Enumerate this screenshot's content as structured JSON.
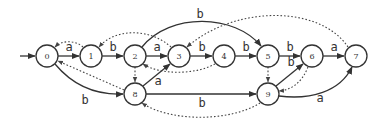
{
  "diagram": {
    "type": "automaton",
    "start_state": "0",
    "nodes": [
      {
        "id": "0",
        "label": "0",
        "x": 47,
        "y": 56
      },
      {
        "id": "1",
        "label": "1",
        "x": 91,
        "y": 56
      },
      {
        "id": "2",
        "label": "2",
        "x": 135,
        "y": 56
      },
      {
        "id": "3",
        "label": "3",
        "x": 179,
        "y": 56
      },
      {
        "id": "4",
        "label": "4",
        "x": 224,
        "y": 56
      },
      {
        "id": "5",
        "label": "5",
        "x": 268,
        "y": 56
      },
      {
        "id": "6",
        "label": "6",
        "x": 312,
        "y": 56
      },
      {
        "id": "7",
        "label": "7",
        "x": 356,
        "y": 56
      },
      {
        "id": "8",
        "label": "8",
        "x": 135,
        "y": 94
      },
      {
        "id": "9",
        "label": "9",
        "x": 268,
        "y": 94
      }
    ],
    "edges": [
      {
        "from": "0",
        "to": "1",
        "label": "a"
      },
      {
        "from": "1",
        "to": "2",
        "label": "b"
      },
      {
        "from": "2",
        "to": "3",
        "label": "a"
      },
      {
        "from": "3",
        "to": "4",
        "label": "b"
      },
      {
        "from": "4",
        "to": "5",
        "label": "b"
      },
      {
        "from": "5",
        "to": "6",
        "label": "b"
      },
      {
        "from": "6",
        "to": "7",
        "label": "a"
      },
      {
        "from": "2",
        "to": "5",
        "label": "b"
      },
      {
        "from": "0",
        "to": "8",
        "label": "b"
      },
      {
        "from": "8",
        "to": "3",
        "label": "a"
      },
      {
        "from": "8",
        "to": "9",
        "label": "b"
      },
      {
        "from": "9",
        "to": "6",
        "label": "b"
      },
      {
        "from": "9",
        "to": "7",
        "label": "a"
      }
    ],
    "failure_links": [
      {
        "from": "1",
        "to": "0"
      },
      {
        "from": "3",
        "to": "1"
      },
      {
        "from": "4",
        "to": "2"
      },
      {
        "from": "7",
        "to": "3"
      },
      {
        "from": "2",
        "to": "8"
      },
      {
        "from": "8",
        "to": "0"
      },
      {
        "from": "5",
        "to": "9"
      },
      {
        "from": "6",
        "to": "9"
      },
      {
        "from": "9",
        "to": "8"
      }
    ],
    "labels": {
      "e01": "a",
      "e12": "b",
      "e23": "a",
      "e34": "b",
      "e45": "b",
      "e56": "b",
      "e67": "a",
      "e25": "b",
      "e08": "b",
      "e83": "a",
      "e89": "b",
      "e96": "b",
      "e97": "a"
    }
  }
}
